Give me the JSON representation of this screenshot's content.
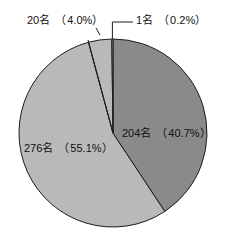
{
  "chart_data": {
    "type": "pie",
    "title": "",
    "subtitle": "",
    "xlabel": "",
    "ylabel": "",
    "grid": false,
    "legend_position": "none",
    "start_angle_deg": 0,
    "direction": "clockwise",
    "center": {
      "x": 113,
      "y": 133
    },
    "radius": 94,
    "categories": [
      "204名",
      "276名",
      "20名",
      "1名"
    ],
    "values": [
      204,
      276,
      20,
      1
    ],
    "percentages": [
      40.7,
      55.1,
      4.0,
      0.2
    ],
    "total": 501,
    "colors": [
      "#8a8a8a",
      "#b9b9b9",
      "#b9b9b9",
      "#b9b9b9"
    ],
    "slices": [
      {
        "id": "slice-204",
        "label": "204名　（40.7%）",
        "count": 204,
        "percent": 40.7,
        "color": "#8a8a8a",
        "label_placement": "inside",
        "start_deg": 0,
        "end_deg": 146.52
      },
      {
        "id": "slice-276",
        "label": "276名　（55.1%）",
        "count": 276,
        "percent": 55.1,
        "color": "#b9b9b9",
        "label_placement": "inside",
        "start_deg": 146.52,
        "end_deg": 344.88
      },
      {
        "id": "slice-20",
        "label": "20名　（4.0%）",
        "count": 20,
        "percent": 4.0,
        "color": "#b9b9b9",
        "label_placement": "outside",
        "start_deg": 344.88,
        "end_deg": 359.28
      },
      {
        "id": "slice-1",
        "label": "1名　（0.2%）",
        "count": 1,
        "percent": 0.2,
        "color": "#b9b9b9",
        "label_placement": "outside",
        "start_deg": 359.28,
        "end_deg": 360
      }
    ],
    "labels": {
      "top_left": "20名　（4.0%）",
      "top_right": "1名　（0.2%）",
      "right_inside": "204名　（40.7%）",
      "left_inside": "276名　（55.1%）"
    }
  },
  "annotations": {
    "leader_20_label": "20名　（4.0%）",
    "leader_1_label": "1名　（0.2%）"
  }
}
